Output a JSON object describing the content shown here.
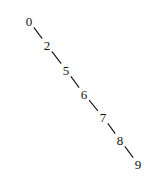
{
  "diagram": {
    "type": "binary-search-tree",
    "nodes": [
      {
        "id": "n0",
        "label": "0",
        "x": 29,
        "y": 21
      },
      {
        "id": "n2",
        "label": "2",
        "x": 47,
        "y": 45
      },
      {
        "id": "n5",
        "label": "5",
        "x": 66,
        "y": 70
      },
      {
        "id": "n6",
        "label": "6",
        "x": 84,
        "y": 94
      },
      {
        "id": "n7",
        "label": "7",
        "x": 103,
        "y": 117
      },
      {
        "id": "n8",
        "label": "8",
        "x": 120,
        "y": 140
      },
      {
        "id": "n9",
        "label": "9",
        "x": 138,
        "y": 164
      }
    ],
    "edges": [
      {
        "from": "n0",
        "to": "n2",
        "side": "right"
      },
      {
        "from": "n2",
        "to": "n5",
        "side": "right"
      },
      {
        "from": "n5",
        "to": "n6",
        "side": "right"
      },
      {
        "from": "n6",
        "to": "n7",
        "side": "right"
      },
      {
        "from": "n7",
        "to": "n8",
        "side": "right"
      },
      {
        "from": "n8",
        "to": "n9",
        "side": "right"
      }
    ],
    "colors": {
      "ink": "#111111",
      "background": "#ffffff"
    }
  }
}
